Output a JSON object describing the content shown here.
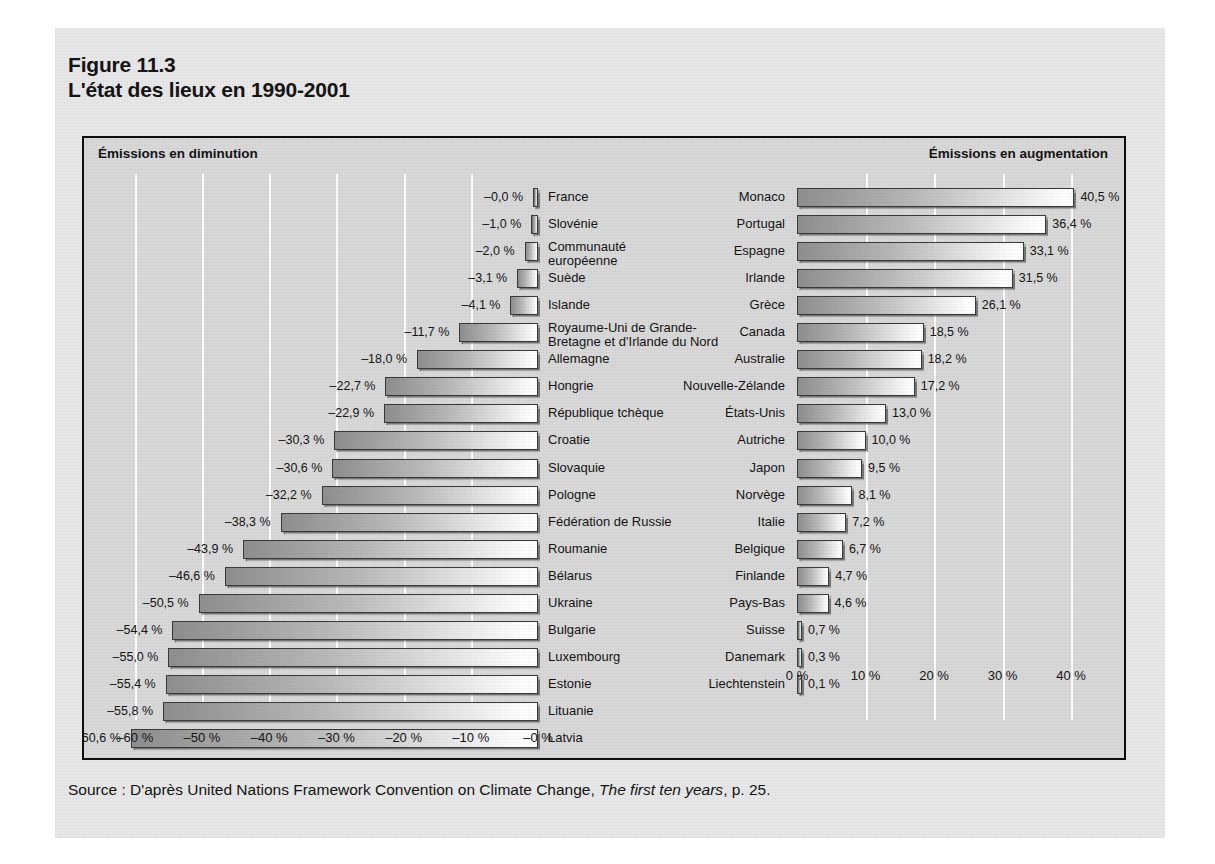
{
  "figure": {
    "number": "Figure 11.3",
    "title": "L'état des lieux en 1990-2001"
  },
  "panels": {
    "left_title": "Émissions en diminution",
    "right_title": "Émissions en augmentation"
  },
  "source": {
    "prefix": "Source : D'après United Nations Framework Convention on Climate Change, ",
    "italic": "The first ten years",
    "suffix": ", p. 25."
  },
  "chart_data": {
    "type": "bar",
    "title": "L'état des lieux en 1990-2001",
    "subtitle": "Figure 11.3",
    "orientation": "horizontal",
    "grid": true,
    "legend": "none",
    "note": "Two back-to-back horizontal bar panels: decreasing emissions (left, negative %) and increasing emissions (right, positive %), 1990-2001.",
    "panels": [
      {
        "name": "decreasing",
        "label": "Émissions en diminution",
        "xlabel": "",
        "ylabel": "",
        "xlim": [
          -60,
          0
        ],
        "ticks": [
          "–60 %",
          "–50 %",
          "–40 %",
          "–30 %",
          "–20 %",
          "–10 %",
          "–0 %"
        ],
        "tick_values": [
          -60,
          -50,
          -40,
          -30,
          -20,
          -10,
          0
        ],
        "categories": [
          "France",
          "Slovénie",
          "Communauté européenne",
          "Suède",
          "Islande",
          "Royaume-Uni de Grande-Bretagne et d'Irlande du Nord",
          "Allemagne",
          "Hongrie",
          "République tchèque",
          "Croatie",
          "Slovaquie",
          "Pologne",
          "Fédération de Russie",
          "Roumanie",
          "Bélarus",
          "Ukraine",
          "Bulgarie",
          "Luxembourg",
          "Estonie",
          "Lituanie",
          "Latvia"
        ],
        "values": [
          -0.0,
          -1.0,
          -2.0,
          -3.1,
          -4.1,
          -11.7,
          -18.0,
          -22.7,
          -22.9,
          -30.3,
          -30.6,
          -32.2,
          -38.3,
          -43.9,
          -46.6,
          -50.5,
          -54.4,
          -55.0,
          -55.4,
          -55.8,
          -60.6
        ],
        "bars": [
          {
            "name": "France",
            "value": -0.0,
            "label": "–0,0 %"
          },
          {
            "name": "Slovénie",
            "value": -1.0,
            "label": "–1,0 %"
          },
          {
            "name": "Communauté européenne",
            "name_line1": "Communauté",
            "name_line2": "européenne",
            "value": -2.0,
            "label": "–2,0 %"
          },
          {
            "name": "Suède",
            "value": -3.1,
            "label": "–3,1 %"
          },
          {
            "name": "Islande",
            "value": -4.1,
            "label": "–4,1 %"
          },
          {
            "name": "Royaume-Uni de Grande-Bretagne et d'Irlande du Nord",
            "name_line1": "Royaume-Uni de Grande-",
            "name_line2": "Bretagne et d'Irlande du Nord",
            "value": -11.7,
            "label": "–11,7 %"
          },
          {
            "name": "Allemagne",
            "value": -18.0,
            "label": "–18,0 %"
          },
          {
            "name": "Hongrie",
            "value": -22.7,
            "label": "–22,7 %"
          },
          {
            "name": "République tchèque",
            "value": -22.9,
            "label": "–22,9 %"
          },
          {
            "name": "Croatie",
            "value": -30.3,
            "label": "–30,3 %"
          },
          {
            "name": "Slovaquie",
            "value": -30.6,
            "label": "–30,6 %"
          },
          {
            "name": "Pologne",
            "value": -32.2,
            "label": "–32,2 %"
          },
          {
            "name": "Fédération de Russie",
            "value": -38.3,
            "label": "–38,3 %"
          },
          {
            "name": "Roumanie",
            "value": -43.9,
            "label": "–43,9 %"
          },
          {
            "name": "Bélarus",
            "value": -46.6,
            "label": "–46,6 %"
          },
          {
            "name": "Ukraine",
            "value": -50.5,
            "label": "–50,5 %"
          },
          {
            "name": "Bulgarie",
            "value": -54.4,
            "label": "–54,4 %"
          },
          {
            "name": "Luxembourg",
            "value": -55.0,
            "label": "–55,0 %"
          },
          {
            "name": "Estonie",
            "value": -55.4,
            "label": "–55,4 %"
          },
          {
            "name": "Lituanie",
            "value": -55.8,
            "label": "–55,8 %"
          },
          {
            "name": "Latvia",
            "value": -60.6,
            "label": "–60,6 %"
          }
        ]
      },
      {
        "name": "increasing",
        "label": "Émissions en augmentation",
        "xlabel": "",
        "ylabel": "",
        "xlim": [
          0,
          45
        ],
        "ticks": [
          "0 %",
          "10 %",
          "20 %",
          "30 %",
          "40 %"
        ],
        "tick_values": [
          0,
          10,
          20,
          30,
          40
        ],
        "categories": [
          "Monaco",
          "Portugal",
          "Espagne",
          "Irlande",
          "Grèce",
          "Canada",
          "Australie",
          "Nouvelle-Zélande",
          "États-Unis",
          "Autriche",
          "Japon",
          "Norvège",
          "Italie",
          "Belgique",
          "Finlande",
          "Pays-Bas",
          "Suisse",
          "Danemark",
          "Liechtenstein"
        ],
        "values": [
          40.5,
          36.4,
          33.1,
          31.5,
          26.1,
          18.5,
          18.2,
          17.2,
          13.0,
          10.0,
          9.5,
          8.1,
          7.2,
          6.7,
          4.7,
          4.6,
          0.7,
          0.3,
          0.1
        ],
        "bars": [
          {
            "name": "Monaco",
            "value": 40.5,
            "label": "40,5 %"
          },
          {
            "name": "Portugal",
            "value": 36.4,
            "label": "36,4 %"
          },
          {
            "name": "Espagne",
            "value": 33.1,
            "label": "33,1 %"
          },
          {
            "name": "Irlande",
            "value": 31.5,
            "label": "31,5 %"
          },
          {
            "name": "Grèce",
            "value": 26.1,
            "label": "26,1 %"
          },
          {
            "name": "Canada",
            "value": 18.5,
            "label": "18,5 %"
          },
          {
            "name": "Australie",
            "value": 18.2,
            "label": "18,2 %"
          },
          {
            "name": "Nouvelle-Zélande",
            "value": 17.2,
            "label": "17,2 %"
          },
          {
            "name": "États-Unis",
            "value": 13.0,
            "label": "13,0 %"
          },
          {
            "name": "Autriche",
            "value": 10.0,
            "label": "10,0 %"
          },
          {
            "name": "Japon",
            "value": 9.5,
            "label": "9,5 %"
          },
          {
            "name": "Norvège",
            "value": 8.1,
            "label": "8,1 %"
          },
          {
            "name": "Italie",
            "value": 7.2,
            "label": "7,2 %"
          },
          {
            "name": "Belgique",
            "value": 6.7,
            "label": "6,7 %"
          },
          {
            "name": "Finlande",
            "value": 4.7,
            "label": "4,7 %"
          },
          {
            "name": "Pays-Bas",
            "value": 4.6,
            "label": "4,6 %"
          },
          {
            "name": "Suisse",
            "value": 0.7,
            "label": "0,7 %"
          },
          {
            "name": "Danemark",
            "value": 0.3,
            "label": "0,3 %"
          },
          {
            "name": "Liechtenstein",
            "value": 0.1,
            "label": "0,1 %"
          }
        ]
      }
    ]
  },
  "colors": {
    "page_background": "#ffffff",
    "card_background": "#e8e8e8",
    "plot_background": "#d9d9d9",
    "frame": "#0e0e0e",
    "gridline": "#ffffff",
    "bar_dark": "#8f8f8f",
    "bar_light": "#ffffff",
    "text": "#141414"
  }
}
